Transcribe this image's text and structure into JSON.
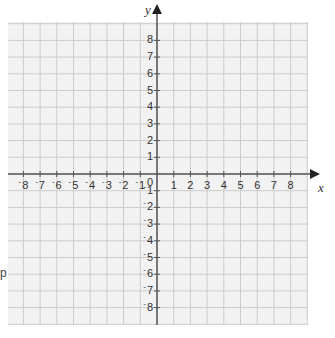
{
  "diagram": {
    "type": "coordinate-grid",
    "x_axis": {
      "label": "x",
      "min": -8,
      "max": 8,
      "ticks": [
        "-8",
        "-7",
        "-6",
        "-5",
        "-4",
        "-3",
        "-2",
        "-1",
        "1",
        "2",
        "3",
        "4",
        "5",
        "6",
        "7",
        "8"
      ]
    },
    "y_axis": {
      "label": "y",
      "min": -8,
      "max": 8,
      "ticks": [
        "8",
        "7",
        "6",
        "5",
        "4",
        "3",
        "2",
        "1",
        "-1",
        "-2",
        "-3",
        "-4",
        "-5",
        "-6",
        "-7",
        "-8"
      ]
    },
    "origin_label": "0",
    "stray_text": "p",
    "colors": {
      "grid_bg": "#f2f2f2",
      "grid_line": "#cccccc",
      "axis": "#555555",
      "text": "#333333"
    }
  }
}
